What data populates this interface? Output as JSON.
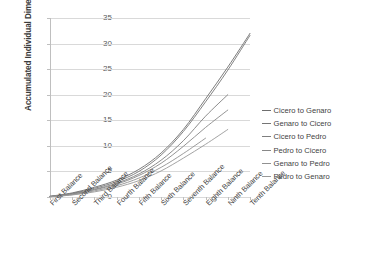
{
  "chart_data": {
    "type": "line",
    "title": "",
    "xlabel": "",
    "ylabel": "Accumulated Individual Dimension",
    "ylim": [
      0,
      35
    ],
    "yticks": [
      0,
      5,
      10,
      15,
      20,
      25,
      30,
      35
    ],
    "grid": true,
    "legend_position": "right",
    "categories": [
      "First Balance",
      "Second Balance",
      "Third Balance",
      "Fourth Balance",
      "Fifth Balance",
      "Sixth Balance",
      "Seventh Balance",
      "Eighth Balance",
      "Ninth Balance",
      "Tenth Balance"
    ],
    "series": [
      {
        "name": "Cicero to Genaro",
        "color": "#6E6E6E",
        "values": [
          0.15,
          0.8,
          1.9,
          3.3,
          5.4,
          8.6,
          13.2,
          19.2,
          25.4,
          32.0
        ]
      },
      {
        "name": "Genaro to Cicero",
        "color": "#757575",
        "values": [
          0.1,
          0.7,
          1.7,
          3.0,
          5.0,
          8.2,
          12.8,
          18.6,
          24.8,
          31.6
        ]
      },
      {
        "name": "Cicero to Pedro",
        "color": "#7F7F7F",
        "values": [
          0.1,
          0.6,
          1.5,
          2.7,
          4.5,
          7.2,
          11.0,
          15.8,
          20.0,
          null
        ]
      },
      {
        "name": "Pedro to Cicero",
        "color": "#888888",
        "values": [
          0.1,
          0.55,
          1.4,
          2.5,
          4.2,
          6.6,
          9.9,
          13.6,
          17.0,
          null
        ]
      },
      {
        "name": "Genaro to Pedro",
        "color": "#919191",
        "values": [
          0.05,
          0.45,
          1.2,
          2.2,
          3.7,
          5.8,
          8.5,
          11.5,
          null,
          null
        ]
      },
      {
        "name": "Pedro to Genaro",
        "color": "#999999",
        "values": [
          0.05,
          0.4,
          1.0,
          1.9,
          3.2,
          5.1,
          7.6,
          10.3,
          13.2,
          null
        ]
      }
    ]
  }
}
